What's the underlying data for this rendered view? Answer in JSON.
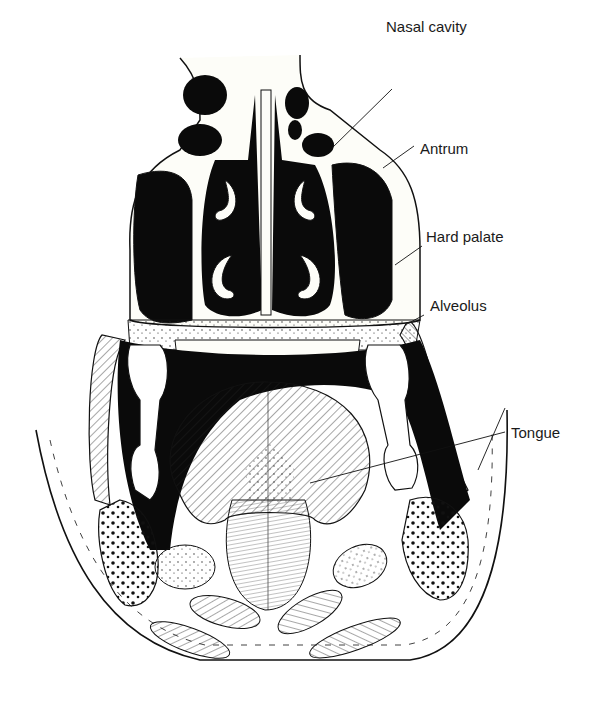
{
  "diagram": {
    "colors": {
      "ink": "#111111",
      "background": "#ffffff",
      "cavity_fill": "#0a0a0a"
    },
    "labels": [
      {
        "id": "nasal-cavity",
        "text": "Nasal cavity",
        "x": 386,
        "y": 30
      },
      {
        "id": "antrum",
        "text": "Antrum",
        "x": 420,
        "y": 140
      },
      {
        "id": "hard-palate",
        "text": "Hard palate",
        "x": 426,
        "y": 228
      },
      {
        "id": "alveolus",
        "text": "Alveolus",
        "x": 430,
        "y": 297
      },
      {
        "id": "tongue",
        "text": "Tongue",
        "x": 511,
        "y": 425
      }
    ]
  }
}
